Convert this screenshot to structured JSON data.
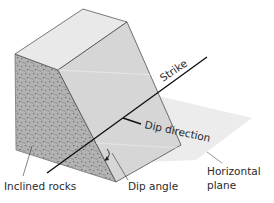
{
  "diagram": {
    "labels": {
      "strike": "Strike",
      "dip_direction": "Dip direction",
      "horizontal_plane_line1": "Horizontal",
      "horizontal_plane_line2": "plane",
      "inclined_rocks": "Inclined rocks",
      "dip_angle": "Dip angle"
    },
    "colors": {
      "top_face": "#e9e9e9",
      "inclined_face": "#d4d4d4",
      "side_face": "#a9a9a9",
      "horizontal_plane": "#ececec",
      "edge": "#3a3a3a",
      "strike_line": "#111111"
    }
  }
}
